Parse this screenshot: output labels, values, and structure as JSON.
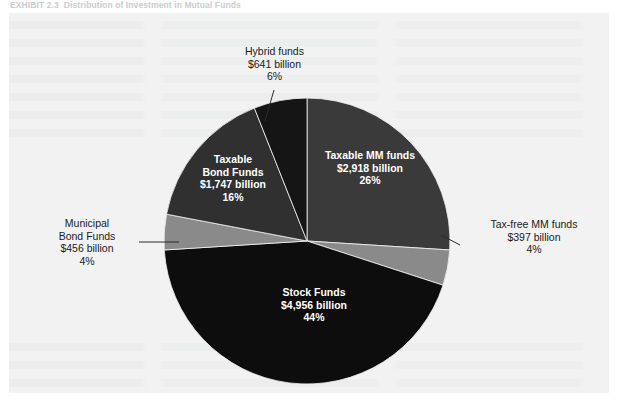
{
  "exhibit": {
    "number": "EXHIBIT 2.3",
    "title": "Distribution of Investment in Mutual Funds"
  },
  "colors": {
    "background": "#f2f2f2",
    "page": "#ffffff",
    "taxable_mm": "#3a3a3a",
    "tax_free_mm": "#8a8a8a",
    "stock": "#0d0d0d",
    "municipal_bond": "#8a8a8a",
    "taxable_bond": "#303030",
    "hybrid": "#151515",
    "label_dark": "#1b1b1b",
    "label_light": "#ffffff",
    "leader_line": "#2a2a2a"
  },
  "chart_data": {
    "type": "pie",
    "title": "Distribution of Investment in Mutual Funds",
    "xlabel": "",
    "ylabel": "",
    "legend_position": "none",
    "grid": false,
    "units": "billions of U.S. dollars",
    "total_value": 11115,
    "categories": [
      "Taxable MM funds",
      "Tax-free MM funds",
      "Stock Funds",
      "Municipal Bond Funds",
      "Taxable Bond Funds",
      "Hybrid funds"
    ],
    "values": [
      2918,
      397,
      4956,
      456,
      1747,
      641
    ],
    "percentages": [
      26,
      4,
      44,
      4,
      16,
      6
    ],
    "slices": [
      {
        "name": "Taxable MM funds",
        "label_line1": "Taxable MM funds",
        "label_line2": "$2,918 billion",
        "label_line3": "26%",
        "value": 2918,
        "percent": 26,
        "color": "#3a3a3a",
        "label_style": "inside"
      },
      {
        "name": "Tax-free MM funds",
        "label_line1": "Tax-free MM funds",
        "label_line2": "$397 billion",
        "label_line3": "4%",
        "value": 397,
        "percent": 4,
        "color": "#8a8a8a",
        "label_style": "outside"
      },
      {
        "name": "Stock Funds",
        "label_line1": "Stock Funds",
        "label_line2": "$4,956 billion",
        "label_line3": "44%",
        "value": 4956,
        "percent": 44,
        "color": "#0d0d0d",
        "label_style": "inside"
      },
      {
        "name": "Municipal Bond Funds",
        "label_line1": "Municipal",
        "label_line2": "Bond Funds",
        "label_line3": "$456 billion",
        "label_line4": "4%",
        "value": 456,
        "percent": 4,
        "color": "#8a8a8a",
        "label_style": "outside"
      },
      {
        "name": "Taxable Bond Funds",
        "label_line1": "Taxable",
        "label_line2": "Bond Funds",
        "label_line3": "$1,747 billion",
        "label_line4": "16%",
        "value": 1747,
        "percent": 16,
        "color": "#303030",
        "label_style": "inside"
      },
      {
        "name": "Hybrid funds",
        "label_line1": "Hybrid funds",
        "label_line2": "$641 billion",
        "label_line3": "6%",
        "value": 641,
        "percent": 6,
        "color": "#151515",
        "label_style": "outside"
      }
    ]
  }
}
